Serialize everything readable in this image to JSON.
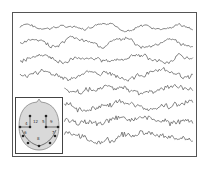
{
  "figure": {
    "type": "eeg-traces-with-electrode-map",
    "channel_count": 8,
    "channels": [
      {
        "name": "channel-1",
        "character": "slow, low-amplitude"
      },
      {
        "name": "channel-2",
        "character": "slow, medium-amplitude"
      },
      {
        "name": "channel-3",
        "character": "mixed"
      },
      {
        "name": "channel-4",
        "character": "mixed with fast activity"
      },
      {
        "name": "channel-5",
        "character": "fast, spiky"
      },
      {
        "name": "channel-6",
        "character": "fast, spiky"
      },
      {
        "name": "channel-7",
        "character": "fast, dense"
      },
      {
        "name": "channel-8",
        "character": "slow, large swings"
      }
    ],
    "inset": {
      "title": "electrode-map",
      "electrode_labels": [
        "4",
        "12",
        "5",
        "9",
        "6",
        "7",
        "8"
      ]
    },
    "colors": {
      "trace": "#666666",
      "frame": "#555555",
      "head_fill": "#d9d9d9",
      "electrode": "#222222"
    }
  }
}
